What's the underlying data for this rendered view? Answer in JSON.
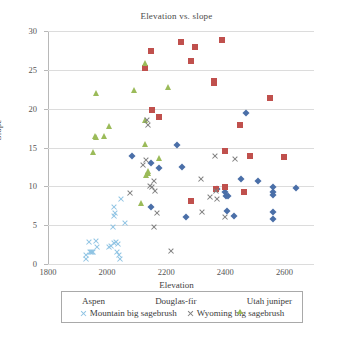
{
  "chart_data": {
    "type": "scatter",
    "title": "Elevation vs. slope",
    "xlabel": "Elevation",
    "ylabel": "Slope",
    "xlim": [
      1800,
      2700
    ],
    "ylim": [
      0,
      30
    ],
    "xticks": [
      1800,
      2000,
      2200,
      2400,
      2600
    ],
    "yticks": [
      0,
      5,
      10,
      15,
      20,
      25,
      30
    ],
    "grid": "horizontal",
    "legend_position": "bottom",
    "series": [
      {
        "name": "Aspen",
        "marker": "diamond",
        "color": "#4a6fa8",
        "points": [
          [
            2085,
            13.9
          ],
          [
            2150,
            13.0
          ],
          [
            2175,
            12.3
          ],
          [
            2150,
            7.35
          ],
          [
            2237,
            15.3
          ],
          [
            2252,
            12.5
          ],
          [
            2400,
            9.3
          ],
          [
            2402,
            8.75
          ],
          [
            2410,
            8.7
          ],
          [
            2405,
            6.85
          ],
          [
            2428,
            6.15
          ],
          [
            2452,
            10.9
          ],
          [
            2470,
            19.5
          ],
          [
            2510,
            10.75
          ],
          [
            2562,
            9.95
          ],
          [
            2562,
            9.3
          ],
          [
            2560,
            8.85
          ],
          [
            2562,
            6.65
          ],
          [
            2560,
            5.85
          ],
          [
            2638,
            9.75
          ],
          [
            2372,
            9.6
          ],
          [
            2268,
            6.0
          ]
        ]
      },
      {
        "name": "Douglas-fir",
        "marker": "square",
        "color": "#c0504d",
        "points": [
          [
            2128,
            25.2
          ],
          [
            2148,
            27.4
          ],
          [
            2152,
            19.85
          ],
          [
            2175,
            18.95
          ],
          [
            2250,
            28.6
          ],
          [
            2283,
            26.2
          ],
          [
            2298,
            27.9
          ],
          [
            2388,
            28.8
          ],
          [
            2360,
            23.3
          ],
          [
            2360,
            23.5
          ],
          [
            2283,
            8.1
          ],
          [
            2368,
            9.65
          ],
          [
            2400,
            9.85
          ],
          [
            2398,
            14.55
          ],
          [
            2448,
            17.85
          ],
          [
            2462,
            9.3
          ],
          [
            2485,
            13.9
          ],
          [
            2552,
            21.4
          ],
          [
            2598,
            13.75
          ]
        ]
      },
      {
        "name": "Utah juniper",
        "marker": "triangle",
        "color": "#9bbb59",
        "points": [
          [
            1963,
            22.0
          ],
          [
            1958,
            16.5
          ],
          [
            1962,
            16.3
          ],
          [
            1988,
            16.5
          ],
          [
            1952,
            14.4
          ],
          [
            2008,
            17.8
          ],
          [
            2092,
            22.4
          ],
          [
            2128,
            25.9
          ],
          [
            2128,
            18.6
          ],
          [
            2128,
            15.5
          ],
          [
            2205,
            22.8
          ],
          [
            2175,
            13.7
          ],
          [
            2140,
            12.0
          ],
          [
            2140,
            11.7
          ],
          [
            2132,
            11.5
          ],
          [
            2115,
            7.9
          ]
        ]
      },
      {
        "name": "Mountain big sagebrush",
        "marker": "x",
        "color": "#8fc4e3",
        "points": [
          [
            1928,
            1.1
          ],
          [
            1930,
            0.6
          ],
          [
            1938,
            2.8
          ],
          [
            1942,
            1.6
          ],
          [
            1944,
            1.5
          ],
          [
            1948,
            1.5
          ],
          [
            1952,
            1.6
          ],
          [
            1962,
            2.9
          ],
          [
            1966,
            2.2
          ],
          [
            2008,
            2.2
          ],
          [
            2012,
            2.3
          ],
          [
            2022,
            2.7
          ],
          [
            2030,
            2.8
          ],
          [
            2032,
            1.6
          ],
          [
            2038,
            2.6
          ],
          [
            2040,
            1.2
          ],
          [
            2042,
            0.6
          ],
          [
            2020,
            4.8
          ],
          [
            2022,
            6.2
          ],
          [
            2026,
            6.6
          ],
          [
            2024,
            7.4
          ],
          [
            2048,
            8.35
          ],
          [
            2062,
            5.3
          ]
        ]
      },
      {
        "name": "Wyoming big sagebrush",
        "marker": "x",
        "color": "#7f7f7f",
        "points": [
          [
            2078,
            9.15
          ],
          [
            2120,
            12.75
          ],
          [
            2130,
            13.4
          ],
          [
            2135,
            18.5
          ],
          [
            2140,
            17.9
          ],
          [
            2145,
            10.0
          ],
          [
            2152,
            9.95
          ],
          [
            2158,
            10.75
          ],
          [
            2162,
            9.45
          ],
          [
            2168,
            6.55
          ],
          [
            2160,
            4.8
          ],
          [
            2215,
            1.7
          ],
          [
            2318,
            10.9
          ],
          [
            2320,
            6.75
          ],
          [
            2348,
            8.6
          ],
          [
            2365,
            13.9
          ],
          [
            2368,
            9.35
          ],
          [
            2372,
            8.35
          ],
          [
            2432,
            13.55
          ],
          [
            2398,
            6.1
          ]
        ]
      }
    ]
  },
  "legend": {
    "items": [
      {
        "label": "Aspen",
        "marker": "diamond-icon"
      },
      {
        "label": "Douglas-fir",
        "marker": "square-icon"
      },
      {
        "label": "Utah juniper",
        "marker": "triangle-icon"
      },
      {
        "label": "Mountain big sagebrush",
        "marker": "x-icon"
      },
      {
        "label": "Wyoming big sagebrush",
        "marker": "x-icon"
      }
    ]
  }
}
